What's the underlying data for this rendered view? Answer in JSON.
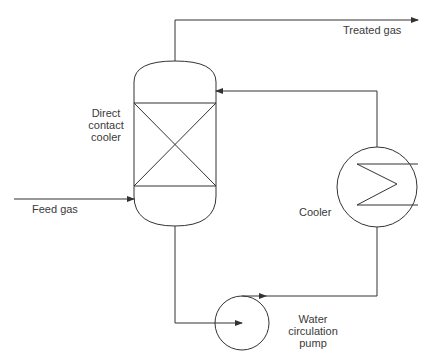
{
  "diagram": {
    "type": "process-flow",
    "line_color": "#333333",
    "background": "#ffffff",
    "labels": {
      "treated_gas": "Treated gas",
      "feed_gas": "Feed gas",
      "dcc_line1": "Direct",
      "dcc_line2": "contact",
      "dcc_line3": "cooler",
      "cooler": "Cooler",
      "pump_line1": "Water",
      "pump_line2": "circulation",
      "pump_line3": "pump"
    },
    "equipment": [
      {
        "id": "direct-contact-cooler",
        "name": "Direct contact cooler",
        "symbol": "packed column"
      },
      {
        "id": "cooler",
        "name": "Cooler",
        "symbol": "heat exchanger"
      },
      {
        "id": "water-circulation-pump",
        "name": "Water circulation pump",
        "symbol": "centrifugal pump"
      }
    ],
    "streams": [
      {
        "name": "Feed gas",
        "from": "inlet",
        "to": "direct-contact-cooler (bottom)"
      },
      {
        "name": "Treated gas",
        "from": "direct-contact-cooler (top)",
        "to": "outlet"
      },
      {
        "name": "Water",
        "from": "direct-contact-cooler (bottom)",
        "to": "water-circulation-pump"
      },
      {
        "name": "Water",
        "from": "water-circulation-pump",
        "to": "cooler"
      },
      {
        "name": "Cooled water",
        "from": "cooler",
        "to": "direct-contact-cooler (top)"
      }
    ]
  }
}
